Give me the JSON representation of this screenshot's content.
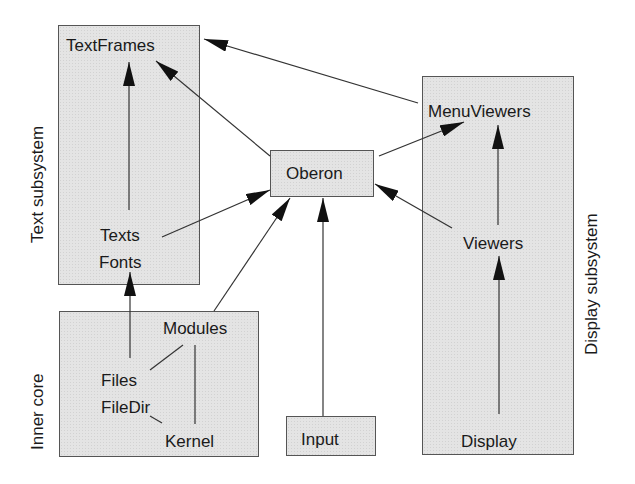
{
  "diagram": {
    "groups": {
      "text_subsystem": {
        "label": "Text subsystem",
        "modules": [
          "TextFrames",
          "Texts",
          "Fonts"
        ]
      },
      "inner_core": {
        "label": "Inner core",
        "modules": [
          "Modules",
          "Files",
          "FileDir",
          "Kernel"
        ]
      },
      "display_subsystem": {
        "label": "Display subsystem",
        "modules": [
          "MenuViewers",
          "Viewers",
          "Display"
        ]
      }
    },
    "nodes": {
      "textframes": "TextFrames",
      "texts": "Texts",
      "fonts": "Fonts",
      "modules": "Modules",
      "files": "Files",
      "filedir": "FileDir",
      "kernel": "Kernel",
      "oberon": "Oberon",
      "input": "Input",
      "menuviewers": "MenuViewers",
      "viewers": "Viewers",
      "display": "Display"
    },
    "edges": [
      {
        "from": "Texts",
        "to": "TextFrames",
        "type": "arrow"
      },
      {
        "from": "Files",
        "to": "Fonts",
        "type": "arrow"
      },
      {
        "from": "Oberon",
        "to": "TextFrames",
        "type": "arrow"
      },
      {
        "from": "MenuViewers",
        "to": "TextFrames",
        "type": "arrow"
      },
      {
        "from": "Texts",
        "to": "Oberon",
        "type": "arrow"
      },
      {
        "from": "Modules",
        "to": "Oberon",
        "type": "arrow"
      },
      {
        "from": "Input",
        "to": "Oberon",
        "type": "arrow"
      },
      {
        "from": "Viewers",
        "to": "Oberon",
        "type": "arrow"
      },
      {
        "from": "Oberon",
        "to": "MenuViewers",
        "type": "arrow"
      },
      {
        "from": "Viewers",
        "to": "MenuViewers",
        "type": "arrow"
      },
      {
        "from": "Display",
        "to": "Viewers",
        "type": "arrow"
      },
      {
        "from": "Modules",
        "to": "Files",
        "type": "line"
      },
      {
        "from": "Modules",
        "to": "Kernel",
        "type": "line"
      },
      {
        "from": "FileDir",
        "to": "Kernel",
        "type": "line"
      }
    ],
    "colors": {
      "box_fill": "#e4e4e4",
      "stroke": "#333333",
      "text": "#1a1a1a"
    }
  }
}
